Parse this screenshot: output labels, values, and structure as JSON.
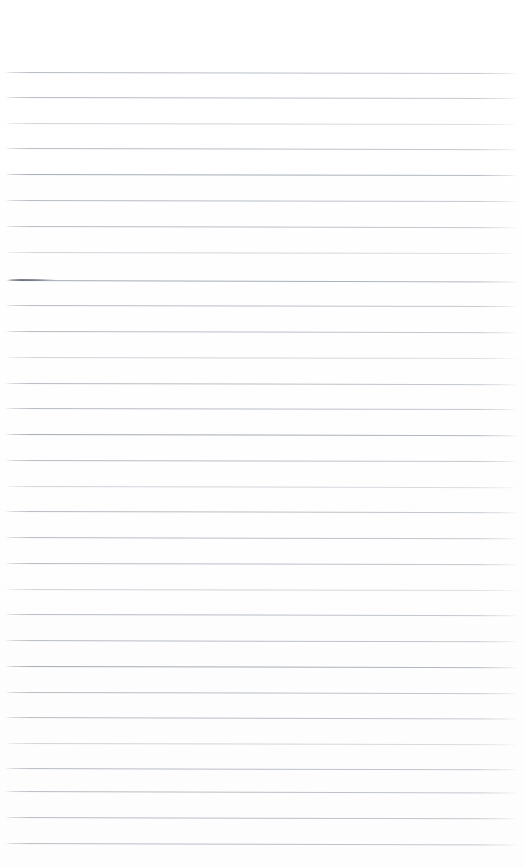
{
  "document": {
    "kind": "scanned-lined-notebook-page",
    "title": "Blank lined notebook page",
    "page_width": 524,
    "page_height": 867,
    "background_color": "#ffffff",
    "has_text": false,
    "visible_text": "",
    "orientation": "portrait"
  },
  "ruling": {
    "line_color": "#b6bcc3",
    "strong_line_color": "#a6adb5",
    "faint_line_color": "#c6cbd2",
    "line_thickness_px": 1,
    "line_count": 31,
    "first_line_y": 72,
    "last_line_y": 843,
    "line_spacing_px": 25.7,
    "left_margin_px": 5,
    "right_end_px": 518,
    "top_blank_margin_px": 72,
    "bottom_blank_margin_px": 24,
    "scan_skew_deg": 0.14,
    "ends_faded": true,
    "lines": [
      {
        "y": 72,
        "weight": "normal",
        "skew": 0.1
      },
      {
        "y": 97,
        "weight": "normal",
        "skew": 0.12
      },
      {
        "y": 123,
        "weight": "faint",
        "skew": 0.11
      },
      {
        "y": 148,
        "weight": "normal",
        "skew": 0.13
      },
      {
        "y": 174,
        "weight": "strong",
        "skew": 0.12
      },
      {
        "y": 200,
        "weight": "normal",
        "skew": 0.1
      },
      {
        "y": 226,
        "weight": "normal",
        "skew": 0.14
      },
      {
        "y": 252,
        "weight": "faint",
        "skew": 0.12
      },
      {
        "y": 280,
        "weight": "strong",
        "skew": 0.16
      },
      {
        "y": 305,
        "weight": "normal",
        "skew": 0.12
      },
      {
        "y": 331,
        "weight": "normal",
        "skew": 0.13
      },
      {
        "y": 357,
        "weight": "faint",
        "skew": 0.11
      },
      {
        "y": 383,
        "weight": "normal",
        "skew": 0.14
      },
      {
        "y": 408,
        "weight": "normal",
        "skew": 0.12
      },
      {
        "y": 434,
        "weight": "strong",
        "skew": 0.13
      },
      {
        "y": 460,
        "weight": "normal",
        "skew": 0.12
      },
      {
        "y": 486,
        "weight": "faint",
        "skew": 0.14
      },
      {
        "y": 511,
        "weight": "normal",
        "skew": 0.13
      },
      {
        "y": 537,
        "weight": "normal",
        "skew": 0.15
      },
      {
        "y": 563,
        "weight": "normal",
        "skew": 0.13
      },
      {
        "y": 589,
        "weight": "faint",
        "skew": 0.12
      },
      {
        "y": 614,
        "weight": "normal",
        "skew": 0.14
      },
      {
        "y": 640,
        "weight": "normal",
        "skew": 0.15
      },
      {
        "y": 666,
        "weight": "strong",
        "skew": 0.13
      },
      {
        "y": 692,
        "weight": "normal",
        "skew": 0.14
      },
      {
        "y": 717,
        "weight": "normal",
        "skew": 0.16
      },
      {
        "y": 743,
        "weight": "faint",
        "skew": 0.14
      },
      {
        "y": 768,
        "weight": "normal",
        "skew": 0.15
      },
      {
        "y": 791,
        "weight": "normal",
        "skew": 0.16
      },
      {
        "y": 817,
        "weight": "normal",
        "skew": 0.15
      },
      {
        "y": 843,
        "weight": "normal",
        "skew": 0.16
      }
    ]
  },
  "pen_stroke": {
    "present": true,
    "description": "short dark stroke at start of line 9",
    "x": 8,
    "y": 279,
    "width": 48,
    "color": "#60666e"
  }
}
